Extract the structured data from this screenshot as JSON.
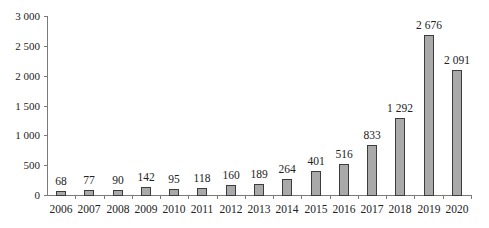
{
  "chart_data": {
    "type": "bar",
    "title": "",
    "xlabel": "",
    "ylabel": "",
    "categories": [
      "2006",
      "2007",
      "2008",
      "2009",
      "2010",
      "2011",
      "2012",
      "2013",
      "2014",
      "2015",
      "2016",
      "2017",
      "2018",
      "2019",
      "2020"
    ],
    "values": [
      68,
      77,
      90,
      142,
      95,
      118,
      160,
      189,
      264,
      401,
      516,
      833,
      1292,
      2676,
      2091
    ],
    "value_labels": [
      "68",
      "77",
      "90",
      "142",
      "95",
      "118",
      "160",
      "189",
      "264",
      "401",
      "516",
      "833",
      "1 292",
      "2 676",
      "2 091"
    ],
    "ylim": [
      0,
      3000
    ],
    "yticks": [
      0,
      500,
      1000,
      1500,
      2000,
      2500,
      3000
    ],
    "ytick_labels": [
      "0",
      "500",
      "1 000",
      "1 500",
      "2 000",
      "2 500",
      "3 000"
    ],
    "grid": false,
    "legend": null,
    "colors": {
      "bar_fill": "#a9a9a9",
      "bar_edge": "#3c3c3c",
      "axis": "#7a7a7a"
    }
  }
}
